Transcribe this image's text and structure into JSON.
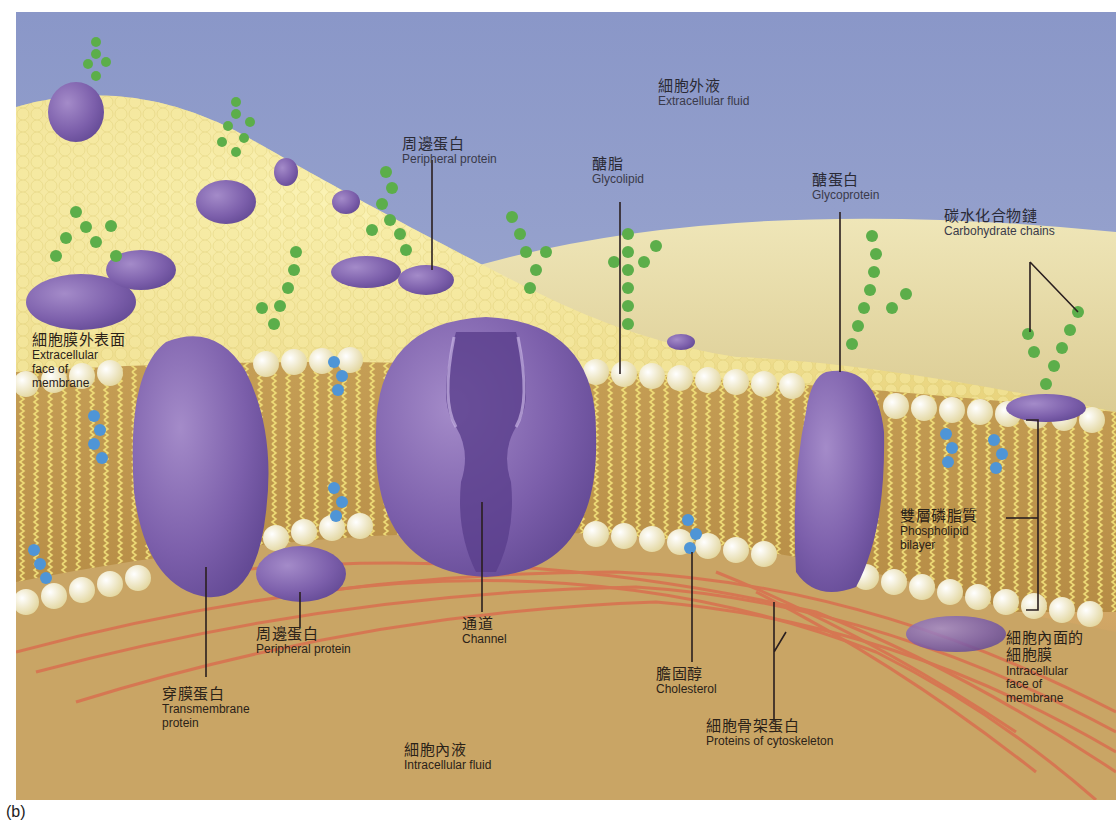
{
  "figure": {
    "panel_tag": "(b)",
    "colors": {
      "extracellular_sky": "#8d9ccc",
      "membrane_surface": "#f2e48c",
      "bilayer_core": "#c19a4f",
      "phospholipid_head": "#f4ecc0",
      "protein_purple": "#7b5ea8",
      "carbohydrate_green": "#5cae4a",
      "cholesterol_blue": "#4f95d6",
      "cytoskeleton_red": "#d9704f",
      "intracellular_fluid": "#c9a565"
    },
    "labels": {
      "extracellular_fluid": {
        "zh": "細胞外液",
        "en": "Extracellular fluid"
      },
      "peripheral_protein_top": {
        "zh": "周邊蛋白",
        "en": "Peripheral protein"
      },
      "glycolipid": {
        "zh": "醣脂",
        "en": "Glycolipid"
      },
      "glycoprotein": {
        "zh": "醣蛋白",
        "en": "Glycoprotein"
      },
      "carbohydrate_chains": {
        "zh": "碳水化合物鏈",
        "en": "Carbohydrate chains"
      },
      "extracellular_face": {
        "zh": "細胞膜外表面",
        "en1": "Extracellular",
        "en2": "face of",
        "en3": "membrane"
      },
      "phospholipid_bilayer": {
        "zh": "雙層磷脂質",
        "en1": "Phospholipid",
        "en2": "bilayer"
      },
      "intracellular_face": {
        "zh1": "細胞內面的",
        "zh2": "細胞膜",
        "en1": "Intracellular",
        "en2": "face of",
        "en3": "membrane"
      },
      "peripheral_protein_bottom": {
        "zh": "周邊蛋白",
        "en": "Peripheral protein"
      },
      "transmembrane_protein": {
        "zh": "穿膜蛋白",
        "en1": "Transmembrane",
        "en2": "protein"
      },
      "channel": {
        "zh": "通道",
        "en": "Channel"
      },
      "cholesterol": {
        "zh": "膽固醇",
        "en": "Cholesterol"
      },
      "cytoskeleton": {
        "zh": "細胞骨架蛋白",
        "en": "Proteins of cytoskeleton"
      },
      "intracellular_fluid": {
        "zh": "細胞內液",
        "en": "Intracellular fluid"
      }
    }
  }
}
